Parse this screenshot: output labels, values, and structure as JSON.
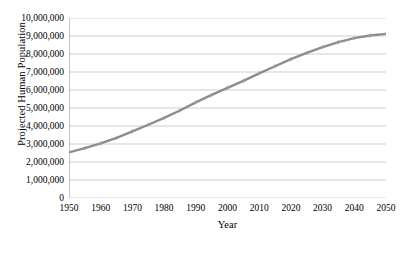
{
  "chart_data": {
    "type": "line",
    "title": "",
    "xlabel": "Year",
    "ylabel": "Projected Human Population",
    "xlim": [
      1950,
      2050
    ],
    "ylim": [
      0,
      10000000
    ],
    "grid": true,
    "legend": false,
    "legend_position": "none",
    "line_color": "#8c8c8c",
    "gridline_color": "#c0c0c0",
    "axis_color": "#808080",
    "marker": "small-cross",
    "y_tick_labels": [
      "10,000,000",
      "9,000,000",
      "8,000,000",
      "7,000,000",
      "6,000,000",
      "5,000,000",
      "4,000,000",
      "3,000,000",
      "2,000,000",
      "1,000,000",
      "0"
    ],
    "y_ticks": [
      10000000,
      9000000,
      8000000,
      7000000,
      6000000,
      5000000,
      4000000,
      3000000,
      2000000,
      1000000,
      0
    ],
    "x_tick_labels": [
      "1950",
      "1960",
      "1970",
      "1980",
      "1990",
      "2000",
      "2010",
      "2020",
      "2030",
      "2040",
      "2050"
    ],
    "x_ticks": [
      1950,
      1960,
      1970,
      1980,
      1990,
      2000,
      2010,
      2020,
      2030,
      2040,
      2050
    ],
    "x": [
      1950,
      1955,
      1960,
      1965,
      1970,
      1975,
      1980,
      1985,
      1990,
      1995,
      2000,
      2005,
      2010,
      2015,
      2020,
      2025,
      2030,
      2035,
      2040,
      2045,
      2050
    ],
    "values": [
      2530000,
      2770000,
      3030000,
      3340000,
      3700000,
      4070000,
      4450000,
      4860000,
      5310000,
      5730000,
      6120000,
      6510000,
      6920000,
      7320000,
      7710000,
      8060000,
      8380000,
      8660000,
      8880000,
      9030000,
      9120000
    ],
    "series": [
      {
        "name": "Projected Human Population",
        "values": [
          2530000,
          2770000,
          3030000,
          3340000,
          3700000,
          4070000,
          4450000,
          4860000,
          5310000,
          5730000,
          6120000,
          6510000,
          6920000,
          7320000,
          7710000,
          8060000,
          8380000,
          8660000,
          8880000,
          9030000,
          9120000
        ]
      }
    ]
  }
}
